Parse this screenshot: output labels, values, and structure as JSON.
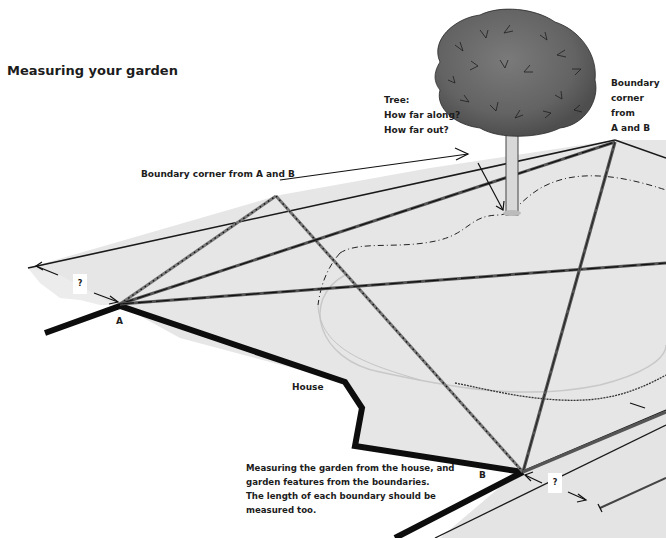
{
  "title": "Measuring your garden",
  "labels": {
    "tree": "Tree:\nHow far along?\nHow far out?",
    "boundary_corner_right": "Boundary\ncorner\nfrom\nA and B",
    "boundary_corner_left": "Boundary corner from A and B",
    "house": "House",
    "point_a": "A",
    "point_b": "B",
    "unknown_a": "?",
    "unknown_b": "?"
  },
  "caption": "Measuring the garden from the house, and\ngarden features from the boundaries.\nThe length of each boundary should be\nmeasured too.",
  "colors": {
    "ground": "#e4e4e4",
    "lawn": "#dcdcdc",
    "wall": "#111111",
    "tape": "#555555",
    "foliage": "#6e6e6e",
    "trunk": "#d0d0d0"
  },
  "icons": {
    "tree": "tree-illustration",
    "arrows": "arrow-icon"
  }
}
